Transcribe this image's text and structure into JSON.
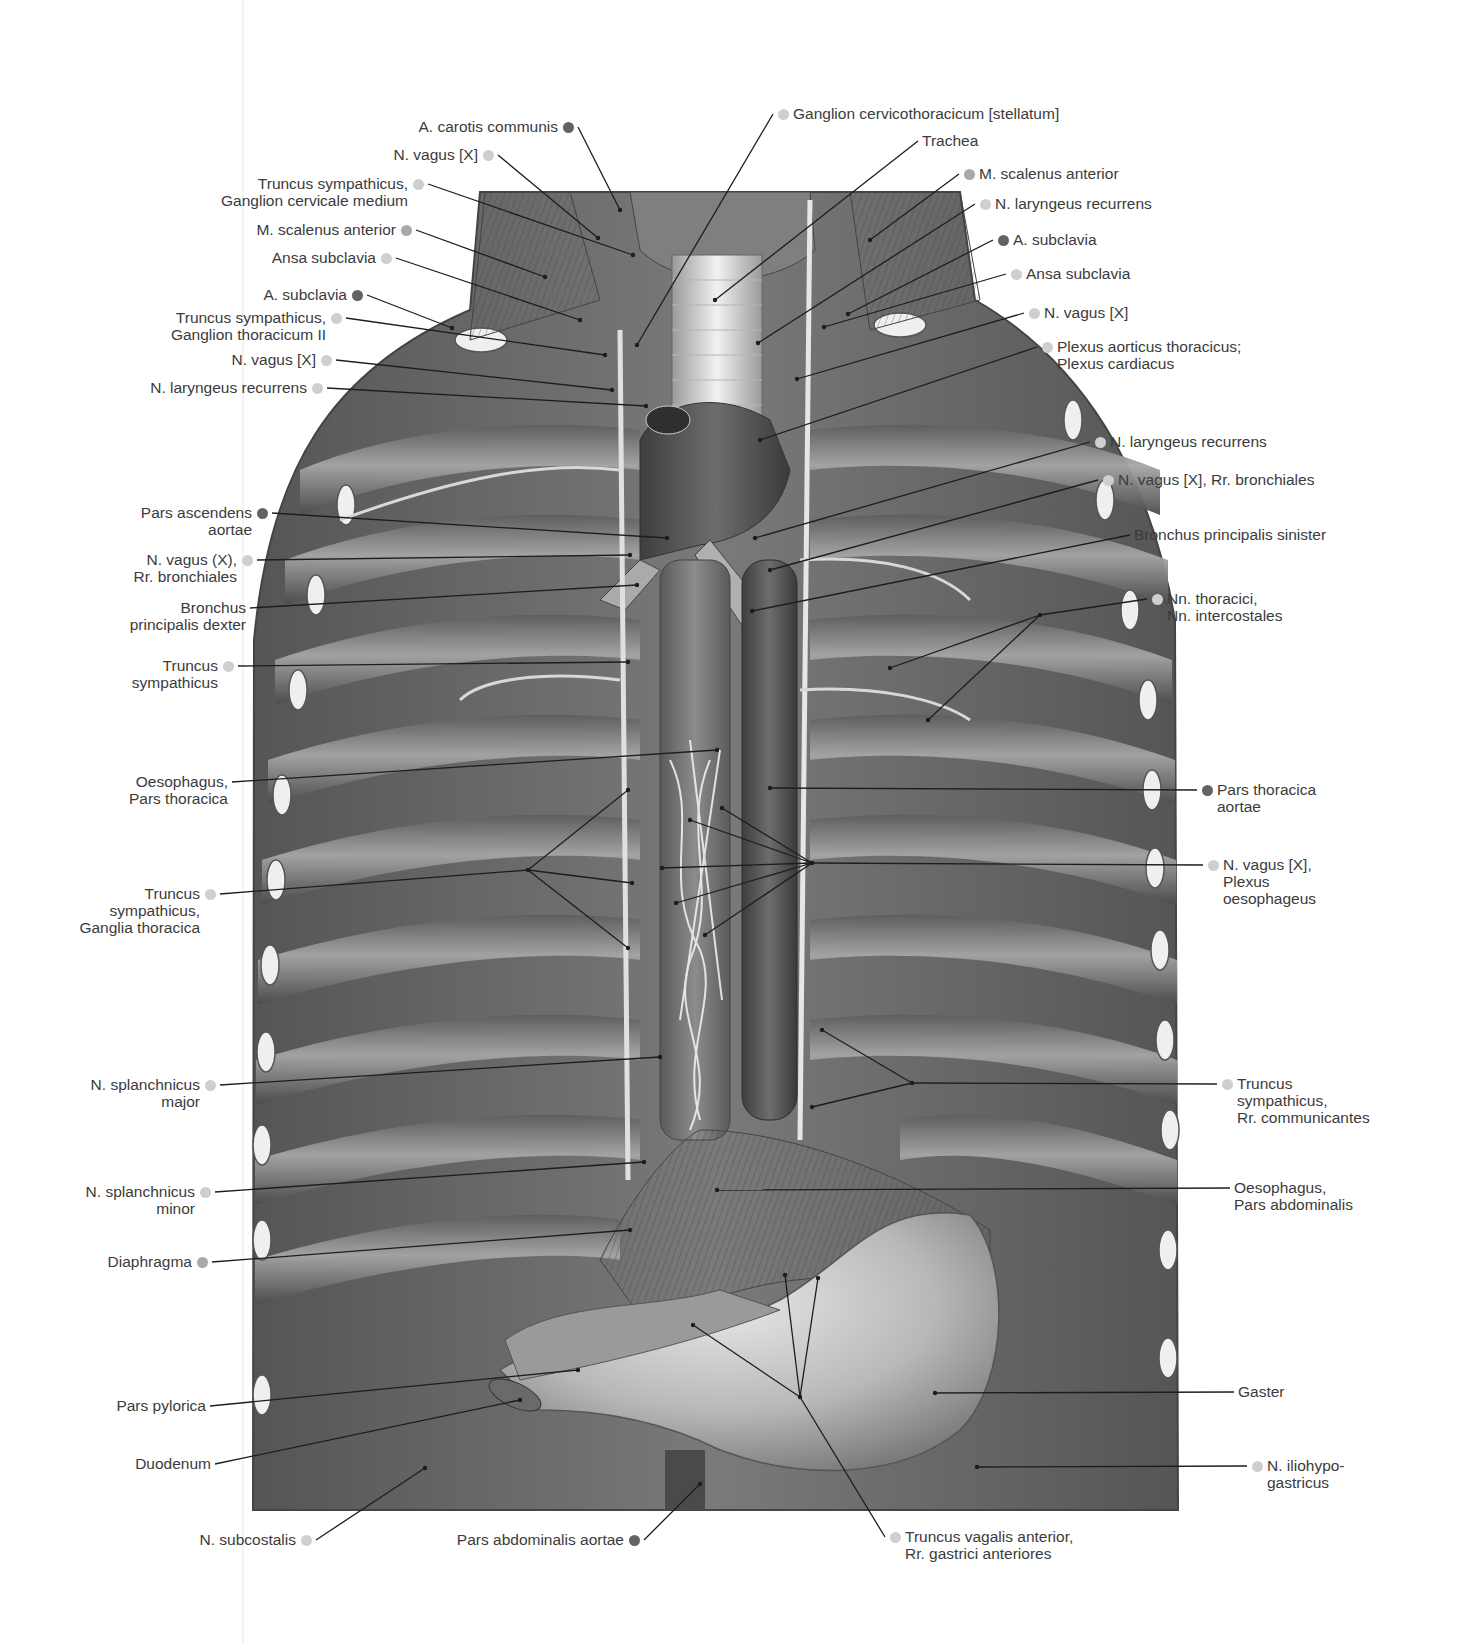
{
  "figure": {
    "type": "anatomical-illustration",
    "legend_dot_colors": {
      "light": "#cfcfcf",
      "mid": "#a9a9a9",
      "dark": "#636363"
    }
  },
  "labels_left": [
    {
      "id": "l1",
      "lines": [
        "A. carotis communis"
      ],
      "dot": "dark",
      "x": 568,
      "y": 127,
      "tx": 620,
      "ty": 210
    },
    {
      "id": "l2",
      "lines": [
        "N. vagus [X]"
      ],
      "dot": "light",
      "x": 488,
      "y": 155,
      "tx": 598,
      "ty": 238
    },
    {
      "id": "l3",
      "lines": [
        "Truncus sympathicus,",
        "Ganglion cervicale medium"
      ],
      "dot": "light",
      "x": 418,
      "y": 184,
      "tx": 633,
      "ty": 255
    },
    {
      "id": "l4",
      "lines": [
        "M. scalenus anterior"
      ],
      "dot": "mid",
      "x": 406,
      "y": 230,
      "tx": 545,
      "ty": 277
    },
    {
      "id": "l5",
      "lines": [
        "Ansa subclavia"
      ],
      "dot": "light",
      "x": 386,
      "y": 258,
      "tx": 580,
      "ty": 320
    },
    {
      "id": "l6",
      "lines": [
        "A. subclavia"
      ],
      "dot": "dark",
      "x": 357,
      "y": 295,
      "tx": 452,
      "ty": 328
    },
    {
      "id": "l7",
      "lines": [
        "Truncus sympathicus,",
        "Ganglion thoracicum II"
      ],
      "dot": "light",
      "x": 336,
      "y": 318,
      "tx": 605,
      "ty": 355
    },
    {
      "id": "l8",
      "lines": [
        "N. vagus [X]"
      ],
      "dot": "light",
      "x": 326,
      "y": 360,
      "tx": 612,
      "ty": 390
    },
    {
      "id": "l9",
      "lines": [
        "N. laryngeus recurrens"
      ],
      "dot": "light",
      "x": 317,
      "y": 388,
      "tx": 646,
      "ty": 406
    },
    {
      "id": "l10",
      "lines": [
        "Pars ascendens",
        "aortae"
      ],
      "dot": "dark",
      "x": 262,
      "y": 513,
      "tx": 667,
      "ty": 538
    },
    {
      "id": "l11",
      "lines": [
        "N. vagus (X),",
        "Rr. bronchiales"
      ],
      "dot": "light",
      "x": 247,
      "y": 560,
      "tx": 630,
      "ty": 555
    },
    {
      "id": "l12",
      "lines": [
        "Bronchus",
        "principalis dexter"
      ],
      "dot": null,
      "x": 250,
      "y": 608,
      "tx": 637,
      "ty": 585
    },
    {
      "id": "l13",
      "lines": [
        "Truncus",
        "sympathicus"
      ],
      "dot": "light",
      "x": 228,
      "y": 666,
      "tx": 628,
      "ty": 662
    },
    {
      "id": "l14",
      "lines": [
        "Oesophagus,",
        "Pars thoracica"
      ],
      "dot": null,
      "x": 232,
      "y": 782,
      "tx": 717,
      "ty": 750
    },
    {
      "id": "l15",
      "lines": [
        "Truncus",
        "sympathicus,",
        "Ganglia thoracica"
      ],
      "dot": "light",
      "x": 210,
      "y": 894,
      "tx": 528,
      "ty": 870,
      "fan": [
        [
          628,
          790
        ],
        [
          632,
          883
        ],
        [
          628,
          948
        ]
      ]
    },
    {
      "id": "l16",
      "lines": [
        "N. splanchnicus",
        "major"
      ],
      "dot": "light",
      "x": 210,
      "y": 1085,
      "tx": 660,
      "ty": 1057
    },
    {
      "id": "l17",
      "lines": [
        "N. splanchnicus",
        "minor"
      ],
      "dot": "light",
      "x": 205,
      "y": 1192,
      "tx": 644,
      "ty": 1162
    },
    {
      "id": "l18",
      "lines": [
        "Diaphragma"
      ],
      "dot": "mid",
      "x": 202,
      "y": 1262,
      "tx": 630,
      "ty": 1230
    },
    {
      "id": "l19",
      "lines": [
        "Pars pylorica"
      ],
      "dot": null,
      "x": 210,
      "y": 1406,
      "tx": 578,
      "ty": 1370
    },
    {
      "id": "l20",
      "lines": [
        "Duodenum"
      ],
      "dot": null,
      "x": 215,
      "y": 1464,
      "tx": 520,
      "ty": 1400
    },
    {
      "id": "l21",
      "lines": [
        "N. subcostalis"
      ],
      "dot": "light",
      "x": 306,
      "y": 1540,
      "tx": 425,
      "ty": 1468
    },
    {
      "id": "l22",
      "lines": [
        "Pars abdominalis aortae"
      ],
      "dot": "dark",
      "x": 634,
      "y": 1540,
      "tx": 700,
      "ty": 1484
    }
  ],
  "labels_right": [
    {
      "id": "r1",
      "lines": [
        "Ganglion cervicothoracicum [stellatum]"
      ],
      "dot": "light",
      "x": 783,
      "y": 114,
      "tx": 637,
      "ty": 345
    },
    {
      "id": "r2",
      "lines": [
        "Trachea"
      ],
      "dot": null,
      "x": 918,
      "y": 141,
      "tx": 715,
      "ty": 300
    },
    {
      "id": "r3",
      "lines": [
        "M. scalenus anterior"
      ],
      "dot": "mid",
      "x": 969,
      "y": 174,
      "tx": 870,
      "ty": 240
    },
    {
      "id": "r4",
      "lines": [
        "N. laryngeus recurrens"
      ],
      "dot": "light",
      "x": 985,
      "y": 204,
      "tx": 758,
      "ty": 343
    },
    {
      "id": "r5",
      "lines": [
        "A. subclavia"
      ],
      "dot": "dark",
      "x": 1003,
      "y": 240,
      "tx": 848,
      "ty": 314
    },
    {
      "id": "r6",
      "lines": [
        "Ansa subclavia"
      ],
      "dot": "light",
      "x": 1016,
      "y": 274,
      "tx": 824,
      "ty": 327
    },
    {
      "id": "r7",
      "lines": [
        "N. vagus [X]"
      ],
      "dot": "light",
      "x": 1034,
      "y": 313,
      "tx": 797,
      "ty": 379
    },
    {
      "id": "r8",
      "lines": [
        "Plexus aorticus thoracicus;",
        "Plexus cardiacus"
      ],
      "dot": "light",
      "x": 1047,
      "y": 347,
      "tx": 760,
      "ty": 440
    },
    {
      "id": "r9",
      "lines": [
        "N. laryngeus recurrens"
      ],
      "dot": "light",
      "x": 1100,
      "y": 442,
      "tx": 755,
      "ty": 538
    },
    {
      "id": "r10",
      "lines": [
        "N. vagus [X], Rr. bronchiales"
      ],
      "dot": "light",
      "x": 1108,
      "y": 480,
      "tx": 770,
      "ty": 570
    },
    {
      "id": "r11",
      "lines": [
        "Bronchus principalis sinister"
      ],
      "dot": null,
      "x": 1130,
      "y": 535,
      "tx": 752,
      "ty": 611
    },
    {
      "id": "r12",
      "lines": [
        "Nn. thoracici,",
        "Nn. intercostales"
      ],
      "dot": "light",
      "x": 1157,
      "y": 599,
      "tx": 1040,
      "ty": 615,
      "fan": [
        [
          890,
          668
        ],
        [
          928,
          720
        ]
      ]
    },
    {
      "id": "r13",
      "lines": [
        "Pars thoracica",
        "aortae"
      ],
      "dot": "dark",
      "x": 1207,
      "y": 790,
      "tx": 770,
      "ty": 788
    },
    {
      "id": "r14",
      "lines": [
        "N. vagus [X],",
        "Plexus",
        "oesophageus"
      ],
      "dot": "light",
      "x": 1213,
      "y": 865,
      "tx": 812,
      "ty": 863,
      "fan": [
        [
          690,
          820
        ],
        [
          722,
          808
        ],
        [
          662,
          868
        ],
        [
          676,
          903
        ],
        [
          705,
          935
        ]
      ]
    },
    {
      "id": "r15",
      "lines": [
        "Truncus",
        "sympathicus,",
        "Rr. communicantes"
      ],
      "dot": "light",
      "x": 1227,
      "y": 1084,
      "tx": 912,
      "ty": 1083,
      "fan": [
        [
          822,
          1030
        ],
        [
          812,
          1107
        ]
      ]
    },
    {
      "id": "r16",
      "lines": [
        "Oesophagus,",
        "Pars abdominalis"
      ],
      "dot": null,
      "x": 1230,
      "y": 1188,
      "tx": 717,
      "ty": 1190
    },
    {
      "id": "r17",
      "lines": [
        "Gaster"
      ],
      "dot": null,
      "x": 1234,
      "y": 1392,
      "tx": 935,
      "ty": 1393
    },
    {
      "id": "r18",
      "lines": [
        "N. iliohypo-",
        "gastricus"
      ],
      "dot": "light",
      "x": 1257,
      "y": 1466,
      "tx": 977,
      "ty": 1467
    },
    {
      "id": "r19",
      "lines": [
        "Truncus vagalis anterior,",
        "Rr. gastrici anteriores"
      ],
      "dot": "light",
      "x": 895,
      "y": 1537,
      "tx": 800,
      "ty": 1397,
      "fan": [
        [
          785,
          1275
        ],
        [
          818,
          1278
        ],
        [
          693,
          1325
        ]
      ]
    }
  ]
}
